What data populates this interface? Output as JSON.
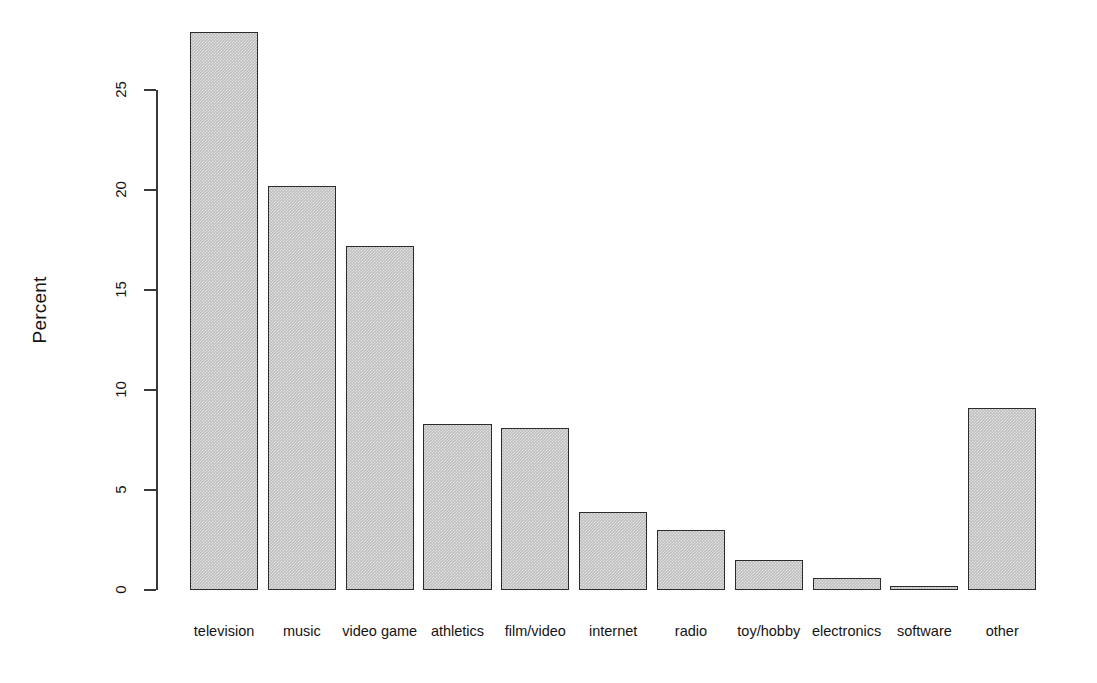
{
  "chart_data": {
    "type": "bar",
    "title": "",
    "subtitle": "",
    "xlabel": "",
    "ylabel": "Percent",
    "ylim": [
      0,
      28.5
    ],
    "yticks": [
      0,
      5,
      10,
      15,
      20,
      25
    ],
    "ytick_labels": [
      "0",
      "5",
      "10",
      "15",
      "20",
      "25"
    ],
    "grid": false,
    "legend": null,
    "orientation": "vertical",
    "bar_color": "#bdbdbd",
    "bar_border_color": "#2b2b2b",
    "categories": [
      "television",
      "music",
      "video game",
      "athletics",
      "film/video",
      "internet",
      "radio",
      "toy/hobby",
      "electronics",
      "software",
      "other"
    ],
    "values": [
      27.9,
      20.2,
      17.2,
      8.3,
      8.1,
      3.9,
      3.0,
      1.5,
      0.6,
      0.15,
      9.1
    ],
    "series": [
      {
        "name": "Percent",
        "values": [
          27.9,
          20.2,
          17.2,
          8.3,
          8.1,
          3.9,
          3.0,
          1.5,
          0.6,
          0.15,
          9.1
        ]
      }
    ]
  },
  "figure": {
    "background": "#ffffff",
    "axis_color": "#3a3a3a",
    "text_color": "#141414"
  }
}
